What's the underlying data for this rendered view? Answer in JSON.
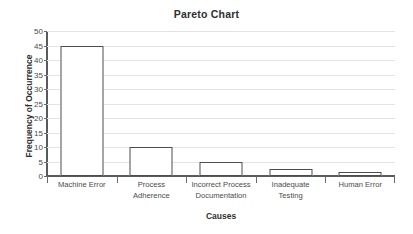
{
  "chart_data": {
    "type": "bar",
    "title": "Pareto Chart",
    "xlabel": "Causes",
    "ylabel": "Frequency of Occurrence",
    "categories": [
      "Machine Error",
      "Process Adherence",
      "Incorrect Process Documentation",
      "Inadequate Testing",
      "Human Error"
    ],
    "category_lines": [
      [
        "Machine Error"
      ],
      [
        "Process",
        "Adherence"
      ],
      [
        "Incorrect Process",
        "Documentation"
      ],
      [
        "Inadequate",
        "Testing"
      ],
      [
        "Human Error"
      ]
    ],
    "values": [
      45,
      10,
      5,
      2.5,
      1.5
    ],
    "ylim": [
      0,
      50
    ],
    "ytick_step": 5,
    "ytick_labels": [
      "0",
      "5",
      "10",
      "15",
      "20",
      "25",
      "30",
      "35",
      "40",
      "45",
      "50"
    ],
    "ytick_values": [
      0,
      5,
      10,
      15,
      20,
      25,
      30,
      35,
      40,
      45,
      50
    ],
    "grid": true,
    "legend": false,
    "colors": {
      "background": "#ffffff",
      "bar_fill": "#ffffff",
      "bar_outline": "#4d4d4d",
      "gridline": "#e3e3e3",
      "axis": "#5a5a5a",
      "title_text": "#2f2f2f",
      "tick_text": "#4a4a4a"
    }
  }
}
